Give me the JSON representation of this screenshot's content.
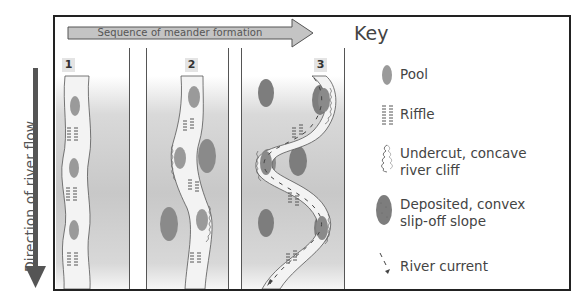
{
  "header": {
    "sequence_label": "Sequence of meander formation"
  },
  "side": {
    "flow_label": "Direction of river flow"
  },
  "panels": [
    {
      "number": "1",
      "stage": "straight channel with alternating pools and riffles"
    },
    {
      "number": "2",
      "stage": "channel begins to bend; undercuts and deposits form"
    },
    {
      "number": "3",
      "stage": "pronounced meander with river current shown"
    }
  ],
  "key": {
    "title": "Key",
    "items": [
      {
        "icon": "pool-icon",
        "label": "Pool"
      },
      {
        "icon": "riffle-icon",
        "label": "Riffle"
      },
      {
        "icon": "river-cliff-icon",
        "label": "Undercut, concave river cliff",
        "line1": "Undercut, concave",
        "line2": "river cliff"
      },
      {
        "icon": "slip-off-slope-icon",
        "label": "Deposited, convex slip-off slope",
        "line1": "Deposited, convex",
        "line2": "slip-off slope"
      },
      {
        "icon": "river-current-icon",
        "label": "River current"
      }
    ]
  },
  "colors": {
    "pool": "#9a9a9a",
    "deposit": "#7d7d7d",
    "channel": "#f3f3f3",
    "floodplain": "#c8c8c8",
    "arrow": "#c4c4c4",
    "flow_arrow": "#555555",
    "border": "#222222"
  }
}
